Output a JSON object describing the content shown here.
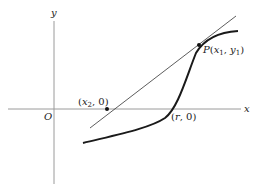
{
  "diagram": {
    "axes": {
      "x_label": "x",
      "y_label": "y",
      "origin_label": "O"
    },
    "points": {
      "tangent_point": {
        "label_prefix": "P",
        "label_open": "(",
        "label_x": "x",
        "label_x_sub": "1",
        "label_sep": ", ",
        "label_y": "y",
        "label_y_sub": "1",
        "label_close": ")"
      },
      "tangent_x_intercept": {
        "label_open": "(",
        "label_x": "x",
        "label_x_sub": "2",
        "label_rest": ", 0)"
      },
      "root": {
        "label_open": "(",
        "label_r": "r",
        "label_rest": ", 0)"
      }
    },
    "colors": {
      "axis": "#9a9a9a",
      "curve": "#1a1a1a",
      "tangent": "#333333",
      "text": "#222222"
    }
  }
}
